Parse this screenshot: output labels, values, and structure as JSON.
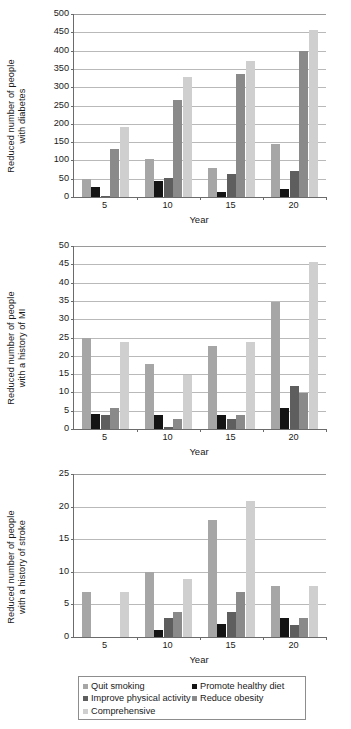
{
  "figure": {
    "xlabel": "Year",
    "categories": [
      "5",
      "10",
      "15",
      "20"
    ]
  },
  "series_colors": {
    "quit_smoking": "#a6a6a6",
    "promote_healthy_diet": "#141414",
    "improve_physical_activity": "#5e5e5e",
    "reduce_obesity": "#8a8a8a",
    "comprehensive": "#cfcfcf",
    "axis": "#6b6b6b",
    "grid": "#b9b9b9"
  },
  "legend": {
    "items": [
      {
        "label": "Quit smoking",
        "color": "#a6a6a6"
      },
      {
        "label": "Promote healthy diet",
        "color": "#141414"
      },
      {
        "label": "Improve physical activity",
        "color": "#5e5e5e"
      },
      {
        "label": "Reduce obesity",
        "color": "#8a8a8a"
      },
      {
        "label": "Comprehensive",
        "color": "#cfcfcf"
      }
    ]
  },
  "chart_data": [
    {
      "type": "bar",
      "id": "diabetes",
      "title": "",
      "ylabel": "Reduced number of people with diabetes",
      "ylabel_lines": [
        "Reduced number of people",
        "with diabetes"
      ],
      "xlabel": "Year",
      "categories": [
        "5",
        "10",
        "15",
        "20"
      ],
      "ylim": [
        0,
        500
      ],
      "yticks": [
        0,
        50,
        100,
        150,
        200,
        250,
        300,
        350,
        400,
        450,
        500
      ],
      "grid": true,
      "legend_position": "bottom-shared",
      "series": [
        {
          "name": "Quit smoking",
          "color": "#a6a6a6",
          "values": [
            50,
            105,
            80,
            146
          ]
        },
        {
          "name": "Promote healthy diet",
          "color": "#141414",
          "values": [
            26,
            45,
            13,
            23
          ]
        },
        {
          "name": "Improve physical activity",
          "color": "#5e5e5e",
          "values": [
            1,
            52,
            62,
            72
          ]
        },
        {
          "name": "Reduce obesity",
          "color": "#8a8a8a",
          "values": [
            131,
            264,
            336,
            398
          ]
        },
        {
          "name": "Comprehensive",
          "color": "#cfcfcf",
          "values": [
            190,
            328,
            372,
            456
          ]
        }
      ]
    },
    {
      "type": "bar",
      "id": "mi",
      "title": "",
      "ylabel": "Reduced number of people with a history of MI",
      "ylabel_lines": [
        "Reduced number of people",
        "with a history of MI"
      ],
      "xlabel": "Year",
      "categories": [
        "5",
        "10",
        "15",
        "20"
      ],
      "ylim": [
        0,
        50
      ],
      "yticks": [
        0,
        5,
        10,
        15,
        20,
        25,
        30,
        35,
        40,
        45,
        50
      ],
      "grid": true,
      "legend_position": "bottom-shared",
      "series": [
        {
          "name": "Quit smoking",
          "color": "#a6a6a6",
          "values": [
            24.8,
            17.7,
            22.6,
            34.8
          ]
        },
        {
          "name": "Promote healthy diet",
          "color": "#141414",
          "values": [
            4.0,
            3.9,
            3.8,
            5.7
          ]
        },
        {
          "name": "Improve physical activity",
          "color": "#5e5e5e",
          "values": [
            3.9,
            0.6,
            2.7,
            11.8
          ]
        },
        {
          "name": "Reduce obesity",
          "color": "#8a8a8a",
          "values": [
            5.7,
            2.7,
            3.8,
            9.8
          ]
        },
        {
          "name": "Comprehensive",
          "color": "#cfcfcf",
          "values": [
            23.7,
            14.8,
            23.7,
            45.7
          ]
        }
      ]
    },
    {
      "type": "bar",
      "id": "stroke",
      "title": "",
      "ylabel": "Reduced number of people with a history of stroke",
      "ylabel_lines": [
        "Reduced number of people",
        "with a history of stroke"
      ],
      "xlabel": "Year",
      "categories": [
        "5",
        "10",
        "15",
        "20"
      ],
      "ylim": [
        0,
        25
      ],
      "yticks": [
        0,
        5,
        10,
        15,
        20,
        25
      ],
      "grid": true,
      "legend_position": "bottom-shared",
      "series": [
        {
          "name": "Quit smoking",
          "color": "#a6a6a6",
          "values": [
            6.9,
            9.9,
            17.9,
            7.9
          ]
        },
        {
          "name": "Promote healthy diet",
          "color": "#141414",
          "values": [
            0,
            1.0,
            2.0,
            2.9
          ]
        },
        {
          "name": "Improve physical activity",
          "color": "#5e5e5e",
          "values": [
            0,
            2.9,
            3.9,
            1.9
          ]
        },
        {
          "name": "Reduce obesity",
          "color": "#8a8a8a",
          "values": [
            0,
            3.9,
            6.9,
            2.9
          ]
        },
        {
          "name": "Comprehensive",
          "color": "#cfcfcf",
          "values": [
            6.9,
            8.9,
            20.9,
            7.9
          ]
        }
      ]
    }
  ]
}
